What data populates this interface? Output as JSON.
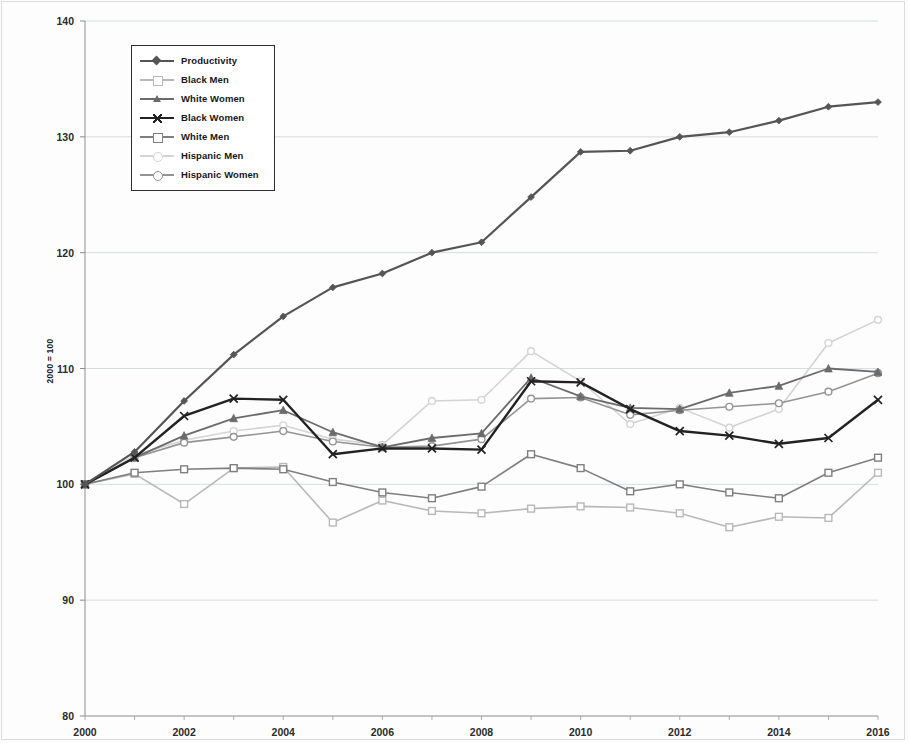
{
  "chart_data": {
    "type": "line",
    "title": "",
    "subtitle": "",
    "xlabel": "",
    "ylabel": "2000 = 100",
    "x": [
      2000,
      2001,
      2002,
      2003,
      2004,
      2005,
      2006,
      2007,
      2008,
      2009,
      2010,
      2011,
      2012,
      2013,
      2014,
      2015,
      2016
    ],
    "xtick_labels": [
      "2000",
      "2002",
      "2004",
      "2006",
      "2008",
      "2010",
      "2012",
      "2014",
      "2016"
    ],
    "xtick_values": [
      2000,
      2002,
      2004,
      2006,
      2008,
      2010,
      2012,
      2014,
      2016
    ],
    "ytick_labels": [
      "80",
      "90",
      "100",
      "110",
      "120",
      "130",
      "140"
    ],
    "ytick_values": [
      80,
      90,
      100,
      110,
      120,
      130,
      140
    ],
    "xlim": [
      2000,
      2016
    ],
    "ylim": [
      80,
      140
    ],
    "grid": "horizontal",
    "legend_position": "upper-left-inside",
    "series": [
      {
        "name": "Productivity",
        "color": "#555555",
        "marker": "diamond",
        "linewidth": 2.2,
        "values": [
          100,
          102.8,
          107.2,
          111.2,
          114.5,
          117.0,
          118.2,
          120.0,
          120.9,
          124.8,
          128.7,
          128.8,
          130.0,
          130.4,
          131.4,
          132.6,
          133.0
        ]
      },
      {
        "name": "Black Men",
        "color": "#b8b8b8",
        "marker": "square",
        "linewidth": 1.6,
        "values": [
          100,
          100.9,
          98.3,
          101.4,
          101.5,
          96.7,
          98.6,
          97.7,
          97.5,
          97.9,
          98.1,
          98.0,
          97.5,
          96.3,
          97.2,
          97.1,
          101.0
        ]
      },
      {
        "name": "White Women",
        "color": "#6b6b6b",
        "marker": "triangle",
        "linewidth": 1.8,
        "values": [
          100,
          102.3,
          104.2,
          105.7,
          106.4,
          104.5,
          103.2,
          104.0,
          104.4,
          109.2,
          107.6,
          106.6,
          106.5,
          107.9,
          108.5,
          110.0,
          109.7
        ]
      },
      {
        "name": "Black Women",
        "color": "#222222",
        "marker": "cross",
        "linewidth": 2.4,
        "values": [
          100,
          102.3,
          105.9,
          107.4,
          107.3,
          102.6,
          103.1,
          103.1,
          103.0,
          108.9,
          108.8,
          106.5,
          104.6,
          104.2,
          103.5,
          104.0,
          107.3
        ]
      },
      {
        "name": "White Men",
        "color": "#7f7f7f",
        "marker": "square",
        "linewidth": 1.6,
        "values": [
          100,
          101.0,
          101.3,
          101.4,
          101.3,
          100.2,
          99.3,
          98.8,
          99.8,
          102.6,
          101.4,
          99.4,
          100.0,
          99.3,
          98.8,
          101.0,
          102.3
        ]
      },
      {
        "name": "Hispanic Men",
        "color": "#d4d4d4",
        "marker": "circle",
        "linewidth": 1.6,
        "values": [
          100,
          102.5,
          103.8,
          104.6,
          105.1,
          103.9,
          103.4,
          107.2,
          107.3,
          111.5,
          108.9,
          105.2,
          106.6,
          104.9,
          106.5,
          112.2,
          114.2
        ]
      },
      {
        "name": "Hispanic Women",
        "color": "#949494",
        "marker": "circle",
        "linewidth": 1.6,
        "values": [
          100,
          102.3,
          103.6,
          104.1,
          104.6,
          103.7,
          103.2,
          103.3,
          103.9,
          107.4,
          107.5,
          106.0,
          106.4,
          106.7,
          107.0,
          108.0,
          109.6
        ]
      }
    ]
  },
  "legend": {
    "items": [
      {
        "label": "Productivity"
      },
      {
        "label": "Black Men"
      },
      {
        "label": "White Women"
      },
      {
        "label": "Black Women"
      },
      {
        "label": "White Men"
      },
      {
        "label": "Hispanic Men"
      },
      {
        "label": "Hispanic Women"
      }
    ]
  },
  "axis": {
    "y_title": "2000 = 100"
  }
}
